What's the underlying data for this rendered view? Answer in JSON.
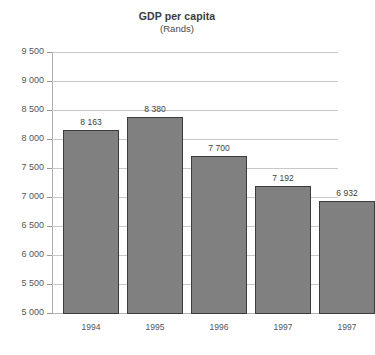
{
  "chart_data": {
    "type": "bar",
    "title": "GDP per capita",
    "subtitle": "(Rands)",
    "xlabel": "",
    "ylabel": "",
    "categories": [
      "1994",
      "1995",
      "1996",
      "1997",
      "1997"
    ],
    "values": [
      8163,
      8380,
      7700,
      7192,
      6932
    ],
    "value_labels": [
      "8 163",
      "8 380",
      "7 700",
      "7 192",
      "6 932"
    ],
    "ylim": [
      5000,
      9500
    ],
    "ytick_step": 500,
    "ytick_labels": [
      "9 500",
      "9 000",
      "8 500",
      "8 000",
      "7 500",
      "7 000",
      "6 500",
      "6 000",
      "5 500",
      "5 000"
    ],
    "ytick_values": [
      9500,
      9000,
      8500,
      8000,
      7500,
      7000,
      6500,
      6000,
      5500,
      5000
    ],
    "grid": true,
    "legend": false,
    "bar_color": "#808080",
    "bar_edge_color": "#3d3d3d",
    "grid_color": "#c8c8c8",
    "background": "#ffffff"
  }
}
